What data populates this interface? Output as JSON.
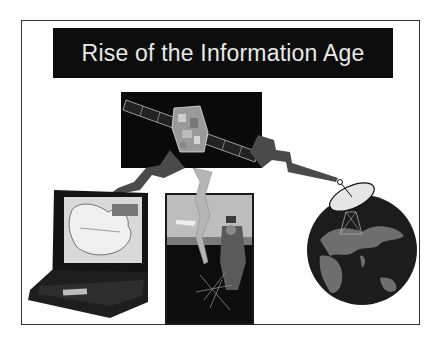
{
  "slide": {
    "title": "Rise of the Information Age",
    "illustrations": [
      {
        "name": "satellite",
        "description": "satellite in orbit on black background"
      },
      {
        "name": "laptop",
        "description": "laptop displaying map"
      },
      {
        "name": "soldier",
        "description": "soldier with field radio antenna"
      },
      {
        "name": "satellite-dish-globe",
        "description": "satellite dish on globe"
      }
    ],
    "colors": {
      "title_background": "#0d0d0d",
      "title_text": "#e8e8e8",
      "lightning_dark": "#4a4a4a",
      "lightning_light": "#b5b5b5",
      "globe_ocean": "#1c1c1c",
      "globe_land": "#6e6e6e"
    }
  }
}
